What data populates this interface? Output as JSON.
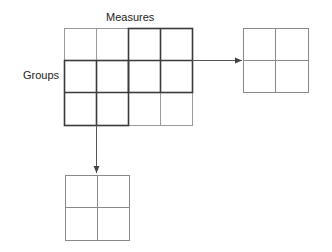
{
  "labels": {
    "columns": "Measures",
    "rows": "Groups"
  },
  "main_grid": {
    "rows": 3,
    "cols": 4,
    "highlight_blocks": [
      {
        "rows": [
          1,
          2
        ],
        "cols": [
          3,
          4
        ]
      },
      {
        "rows": [
          2,
          3
        ],
        "cols": [
          1,
          2
        ]
      }
    ]
  },
  "output_grids": [
    {
      "name": "right-result",
      "rows": 2,
      "cols": 2
    },
    {
      "name": "bottom-result",
      "rows": 2,
      "cols": 2
    }
  ],
  "colors": {
    "light_line": "#9a9a9a",
    "dark_line": "#3a3a3a",
    "arrow": "#555555"
  }
}
